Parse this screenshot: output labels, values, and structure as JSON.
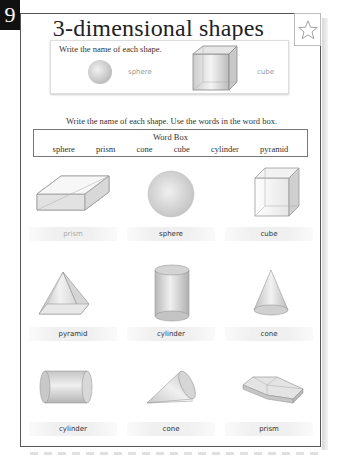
{
  "page_number": "9",
  "title": "3-dimensional shapes",
  "star_icon": "star-outline-icon",
  "example": {
    "instruction": "Write the name of each shape.",
    "items": [
      {
        "shape": "sphere",
        "answer": "sphere"
      },
      {
        "shape": "cube",
        "answer": "cube"
      }
    ]
  },
  "instruction": "Write the name of each shape. Use the words in the word box.",
  "word_box": {
    "title": "Word Box",
    "words": [
      "sphere",
      "prism",
      "cone",
      "cube",
      "cylinder",
      "pyramid"
    ]
  },
  "grid": [
    {
      "shape": "rectangular-prism",
      "answer": "prism"
    },
    {
      "shape": "sphere",
      "answer": "sphere"
    },
    {
      "shape": "cube",
      "answer": "cube"
    },
    {
      "shape": "pyramid",
      "answer": "pyramid"
    },
    {
      "shape": "cylinder-upright",
      "answer": "cylinder"
    },
    {
      "shape": "cone-upright",
      "answer": "cone"
    },
    {
      "shape": "cylinder-sideways",
      "answer": "cylinder"
    },
    {
      "shape": "cone-tilted",
      "answer": "cone"
    },
    {
      "shape": "hexagonal-prism-flat",
      "answer": "prism"
    }
  ],
  "colors": {
    "border": "#555555",
    "text": "#333333",
    "faint_text": "#999999",
    "shape_fill": "#d9d9d9"
  }
}
